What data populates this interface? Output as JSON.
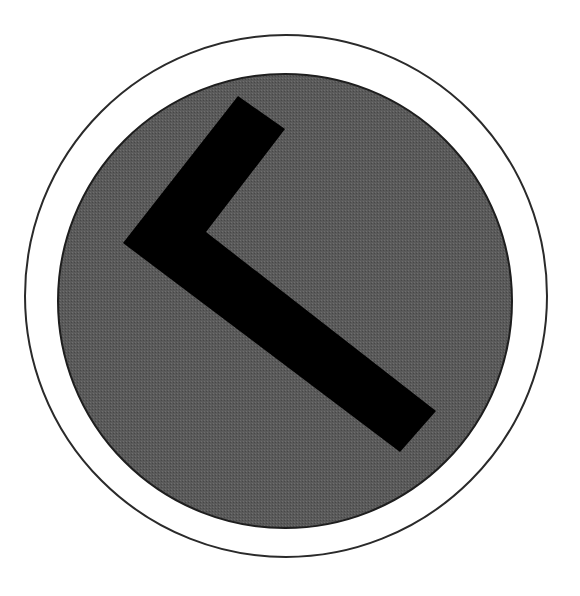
{
  "image": {
    "description": "Circular sign with a black chevron pointing left on a gray disc inside a thin outer ring",
    "icon": "chevron-left-icon",
    "colors": {
      "background": "#ffffff",
      "outer_ring_stroke": "#2a2a2a",
      "disc_fill": "#5a5a5a",
      "disc_edge": "#1e1e1e",
      "chevron_fill": "#000000"
    },
    "geometry": {
      "outer_ring": {
        "cx": 286,
        "cy": 296,
        "r": 261,
        "stroke_width": 2
      },
      "disc": {
        "cx": 285,
        "cy": 301,
        "r": 227
      },
      "chevron_points": [
        [
          238,
          96
        ],
        [
          285,
          129
        ],
        [
          206,
          232
        ],
        [
          436,
          411
        ],
        [
          400,
          452
        ],
        [
          123,
          243
        ]
      ]
    }
  }
}
